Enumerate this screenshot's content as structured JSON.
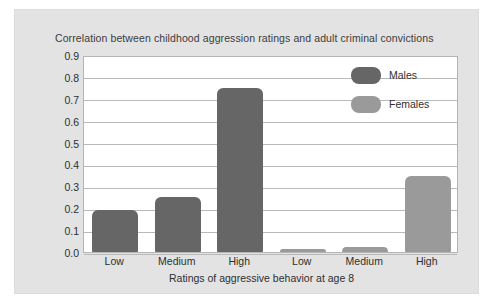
{
  "chart_data": {
    "type": "bar",
    "title": "Correlation between childhood aggression ratings and adult criminal convictions",
    "xlabel": "Ratings of aggressive behavior at age 8",
    "ylabel": "",
    "categories": [
      "Low",
      "Medium",
      "High"
    ],
    "grouping": "separated-groups",
    "series": [
      {
        "name": "Males",
        "color": "#666666",
        "values": [
          0.19,
          0.25,
          0.75
        ]
      },
      {
        "name": "Females",
        "color": "#9a9a9a",
        "values": [
          0.015,
          0.025,
          0.345
        ]
      }
    ],
    "ylim": [
      0.0,
      0.9
    ],
    "ytick_labels": [
      "0.9",
      "0.8",
      "0.7",
      "0.6",
      "0.5",
      "0.4",
      "0.3",
      "0.2",
      "0.1",
      "0.0"
    ],
    "ytick_values": [
      0.9,
      0.8,
      0.7,
      0.6,
      0.5,
      0.4,
      0.3,
      0.2,
      0.1,
      0.0
    ],
    "xtick_labels": [
      "Low",
      "Medium",
      "High",
      "Low",
      "Medium",
      "High"
    ],
    "grid": true,
    "legend_position": "top-right",
    "legend_entries": [
      "Males",
      "Females"
    ]
  },
  "bars": [
    {
      "label": "Low",
      "series": "Males",
      "value": 0.19,
      "slot": 0
    },
    {
      "label": "Medium",
      "series": "Males",
      "value": 0.25,
      "slot": 1
    },
    {
      "label": "High",
      "series": "Males",
      "value": 0.75,
      "slot": 2
    },
    {
      "label": "Low",
      "series": "Females",
      "value": 0.015,
      "slot": 3
    },
    {
      "label": "Medium",
      "series": "Females",
      "value": 0.025,
      "slot": 4
    },
    {
      "label": "High",
      "series": "Females",
      "value": 0.345,
      "slot": 5
    }
  ],
  "colors": {
    "males": "#666666",
    "females": "#9a9a9a",
    "panel_background": "#e3e3e3",
    "plot_background": "#ffffff",
    "gridline": "#b9b9b9",
    "text": "#2f2f2f"
  }
}
